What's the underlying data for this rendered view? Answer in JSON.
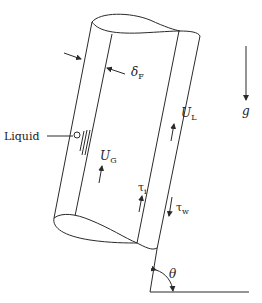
{
  "diagram": {
    "type": "inclined-pipe-annular-flow",
    "labels": {
      "film_thickness": {
        "main": "δ",
        "sub": "F"
      },
      "liquid_velocity": {
        "main": "U",
        "sub": "L"
      },
      "gas_velocity": {
        "main": "U",
        "sub": "G"
      },
      "gravity": "g",
      "liquid": "Liquid",
      "interfacial_stress": {
        "main": "τ",
        "sub": "i"
      },
      "wall_stress": {
        "main": "τ",
        "sub": "w"
      },
      "angle": "θ"
    },
    "colors": {
      "stroke": "#2a2a2a",
      "background": "#ffffff"
    }
  }
}
